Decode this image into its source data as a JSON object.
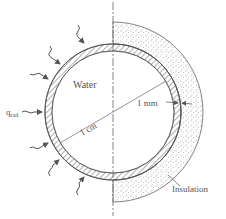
{
  "diagram": {
    "labels": {
      "water": "Water",
      "q_rad": "q",
      "q_rad_sub": "rad",
      "diameter": "1 cm",
      "thickness": "1 mm",
      "insulation": "Insulation"
    },
    "colors": {
      "line": "#555555",
      "hatch": "#777777",
      "stipple": "#9a9a9a",
      "background": "#ffffff"
    }
  }
}
